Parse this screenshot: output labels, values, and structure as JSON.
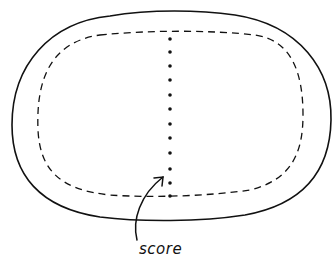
{
  "diagram": {
    "labels": {
      "score": "score"
    },
    "elements": [
      "outer-outline",
      "inner-dashed-outline",
      "score-line",
      "arrow"
    ],
    "colors": {
      "stroke": "#111111",
      "background": "#ffffff"
    }
  }
}
